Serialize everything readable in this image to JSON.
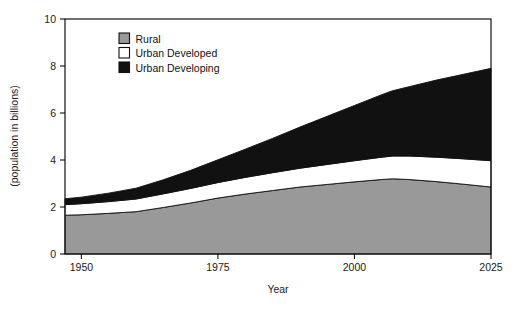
{
  "chart_data": {
    "type": "area",
    "stacked": true,
    "title": "",
    "xlabel": "Year",
    "ylabel": "(population in billions)",
    "xlim": [
      1947,
      2025
    ],
    "ylim": [
      0,
      10
    ],
    "xticks": [
      1950,
      1975,
      2000,
      2025
    ],
    "xtick_labels": [
      "1950",
      "1975",
      "2000",
      "2025"
    ],
    "yticks": [
      0,
      2,
      4,
      6,
      8,
      10
    ],
    "ytick_labels": [
      "0",
      "2",
      "4",
      "6",
      "8",
      "10"
    ],
    "grid": false,
    "legend_position": "top-left-inside",
    "x": [
      1947,
      1950,
      1955,
      1960,
      1965,
      1970,
      1975,
      1980,
      1985,
      1990,
      1995,
      2000,
      2005,
      2007,
      2010,
      2015,
      2020,
      2025
    ],
    "series": [
      {
        "name": "Rural",
        "color": "#999999",
        "values": [
          1.65,
          1.67,
          1.73,
          1.8,
          1.98,
          2.17,
          2.38,
          2.55,
          2.7,
          2.85,
          2.96,
          3.07,
          3.17,
          3.2,
          3.17,
          3.08,
          2.97,
          2.85
        ]
      },
      {
        "name": "Urban Developed",
        "color": "#ffffff",
        "values": [
          0.45,
          0.47,
          0.5,
          0.54,
          0.58,
          0.62,
          0.66,
          0.71,
          0.76,
          0.8,
          0.85,
          0.9,
          0.95,
          0.97,
          1.0,
          1.04,
          1.08,
          1.12
        ]
      },
      {
        "name": "Urban Developing",
        "color": "#111111",
        "values": [
          0.25,
          0.28,
          0.36,
          0.46,
          0.6,
          0.77,
          0.97,
          1.2,
          1.46,
          1.75,
          2.05,
          2.35,
          2.66,
          2.78,
          2.95,
          3.28,
          3.6,
          3.93
        ]
      }
    ],
    "legend": [
      {
        "label": "Rural",
        "swatch": "#999999"
      },
      {
        "label": "Urban Developed",
        "swatch": "#ffffff"
      },
      {
        "label": "Urban Developing",
        "swatch": "#111111"
      }
    ]
  }
}
